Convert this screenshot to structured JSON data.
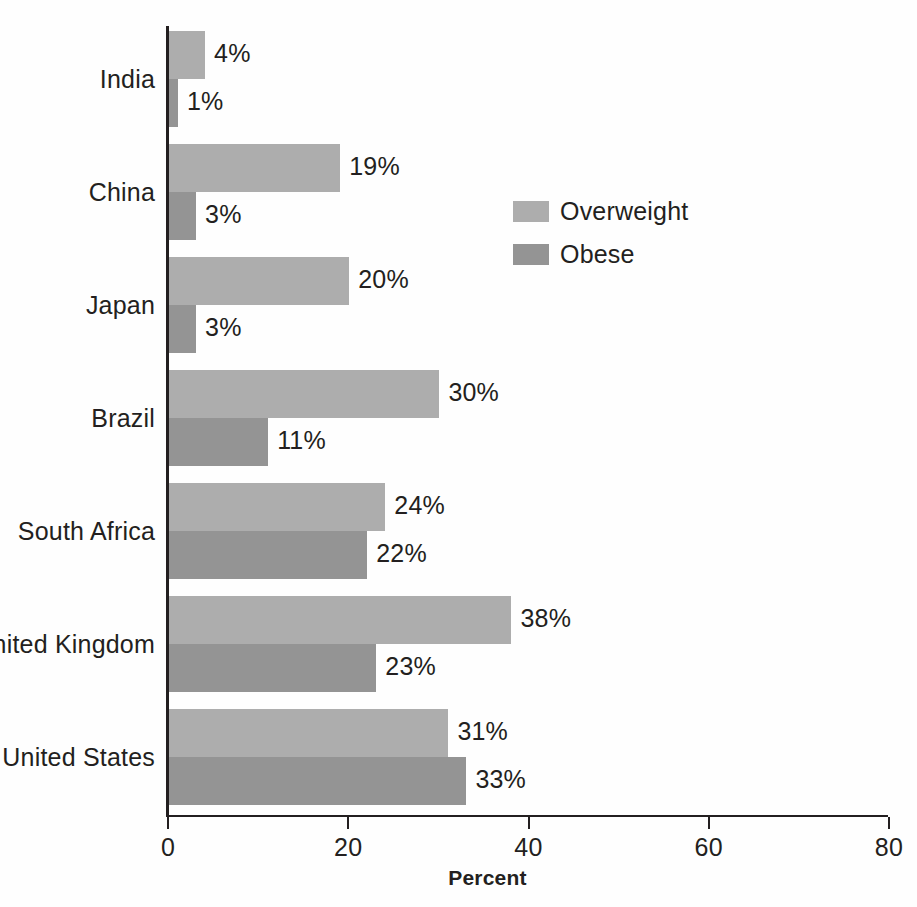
{
  "chart_data": {
    "type": "bar",
    "orientation": "horizontal",
    "title": "",
    "xlabel": "Percent",
    "ylabel": "",
    "xlim": [
      0,
      80
    ],
    "xticks": [
      "0",
      "20",
      "40",
      "60",
      "80"
    ],
    "grid": false,
    "legend_position": "center-right",
    "categories": [
      "India",
      "China",
      "Japan",
      "Brazil",
      "South Africa",
      "United Kingdom",
      "United States"
    ],
    "series": [
      {
        "name": "Overweight",
        "color": "#adadad",
        "values": [
          4,
          19,
          20,
          30,
          24,
          38,
          31
        ],
        "labels": [
          "4%",
          "19%",
          "20%",
          "30%",
          "24%",
          "38%",
          "31%"
        ]
      },
      {
        "name": "Obese",
        "color": "#949494",
        "values": [
          1,
          3,
          3,
          11,
          22,
          23,
          33
        ],
        "labels": [
          "1%",
          "3%",
          "3%",
          "11%",
          "22%",
          "23%",
          "33%"
        ]
      }
    ]
  },
  "axis": {
    "x_title": "Percent",
    "ticks": [
      {
        "value": 0,
        "label": "0"
      },
      {
        "value": 20,
        "label": "20"
      },
      {
        "value": 40,
        "label": "40"
      },
      {
        "value": 60,
        "label": "60"
      },
      {
        "value": 80,
        "label": "80"
      }
    ]
  },
  "legend": {
    "items": [
      {
        "label": "Overweight",
        "color": "#adadad"
      },
      {
        "label": "Obese",
        "color": "#949494"
      }
    ]
  },
  "colors": {
    "overweight": "#adadad",
    "obese": "#949494",
    "axis": "#231f20",
    "background": "#ffffff"
  }
}
